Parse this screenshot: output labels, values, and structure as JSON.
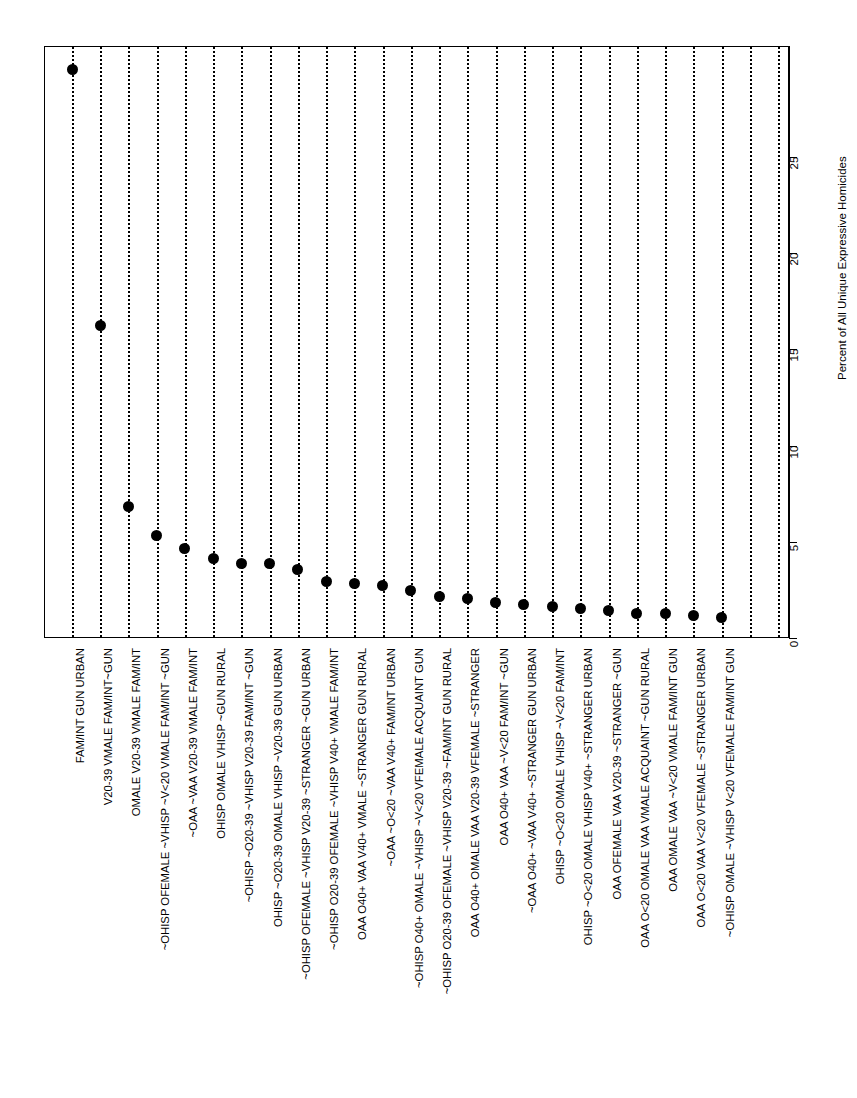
{
  "chart_data": {
    "type": "scatter",
    "orientation": "vertical-stems",
    "title": "",
    "subtitle": "",
    "xlabel": "",
    "ylabel": "Percent of All Unique Expressive Homicides",
    "ylim": [
      0,
      29
    ],
    "yticks": [
      0,
      5,
      10,
      15,
      20,
      25
    ],
    "ytick_labels": [
      "0",
      "5",
      "10",
      "15",
      "20",
      "25"
    ],
    "grid": false,
    "legend": null,
    "marker": "filled-circle",
    "stem_style": "dotted",
    "categories": [
      "FAM/INT GUN URBAN",
      "V20-39 VMALE FAM/INT~GUN",
      "OMALE V20-39 VMALE FAM/INT",
      "~OHISP OFEMALE ~VHISP ~V<20 VMALE FAM/INT ~GUN",
      "~OAA ~VAA V20-39 VMALE FAM/INT",
      "OHISP OMALE VHISP ~GUN RURAL",
      "~OHISP ~O20-39 ~VHISP V20-39 FAM/INT ~GUN",
      "OHISP ~O20-39 OMALE VHISP ~V20-39 GUN URBAN",
      "~OHISP OFEMALE ~VHISP V20-39 ~STRANGER ~GUN URBAN",
      "~OHISP O20-39 OFEMALE ~VHISP V40+ VMALE FAM/INT",
      "OAA O40+ VAA V40+ VMALE ~STRANGER GUN RURAL",
      "~OAA ~O<20 ~VAA V40+ FAM/INT URBAN",
      "~OHISP O40+ OMALE ~VHISP ~V<20 VFEMALE ACQUAINT GUN",
      "~OHISP O20-39 OFEMALE ~VHISP V20-39 ~FAM/INT GUN RURAL",
      "OAA O40+ OMALE VAA V20-39 VFEMALE ~STRANGER",
      "OAA O40+ VAA ~V<20 FAM/INT ~GUN",
      "~OAA O40+ ~VAA V40+ ~STRANGER GUN URBAN",
      "OHISP ~O<20 OMALE VHISP ~V<20 FAM/INT",
      "OHISP ~O<20 OMALE VHISP V40+ ~STRANGER URBAN",
      "OAA OFEMALE VAA V20-39 ~STRANGER ~GUN",
      "OAA O<20 OMALE VAA VMALE ACQUAINT ~GUN RURAL",
      "OAA OMALE VAA ~V<20 VMALE FAM/INT GUN",
      "OAA O<20 VAA V<20 VFEMALE ~STRANGER URBAN",
      "~OHISP OMALE ~VHISP V<20 VFEMALE FAM/INT GUN"
    ],
    "values": [
      29.6,
      16.3,
      6.9,
      5.4,
      4.7,
      4.2,
      3.9,
      3.9,
      3.6,
      3.0,
      2.9,
      2.8,
      2.5,
      2.2,
      2.1,
      1.9,
      1.8,
      1.7,
      1.6,
      1.5,
      1.3,
      1.3,
      1.2,
      1.1
    ],
    "stem_count": 26
  },
  "axis": {
    "value_axis_title": "Percent of All Unique Expressive Homicides",
    "ticks": [
      "0",
      "5",
      "10",
      "15",
      "20",
      "25"
    ]
  }
}
